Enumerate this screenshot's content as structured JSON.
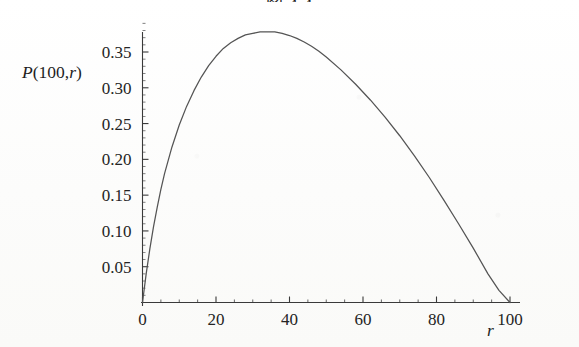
{
  "figure": {
    "caption": "图 4.4",
    "caption_visible_fragment": "图 4.4",
    "background_color": "#fdfdfc",
    "curve_color": "#545454",
    "axis_color": "#3a3a3a"
  },
  "axes": {
    "y_axis_title": "P(100,r)",
    "y_axis_title_parts": {
      "symbol": "P",
      "args": "(100,",
      "variable": "r",
      "close": ")"
    },
    "x_axis_title": "r",
    "x_tick_labels": [
      "0",
      "20",
      "40",
      "60",
      "80",
      "100"
    ],
    "y_tick_labels": [
      "0.05",
      "0.10",
      "0.15",
      "0.20",
      "0.25",
      "0.30",
      "0.35"
    ]
  },
  "chart_data": {
    "type": "line",
    "title": "图 4.4",
    "xlabel": "r",
    "ylabel": "P(100,r)",
    "xlim": [
      0,
      103
    ],
    "ylim": [
      0,
      0.392
    ],
    "grid": false,
    "legend": "none",
    "x_ticks": [
      0,
      20,
      40,
      60,
      80,
      100
    ],
    "y_ticks": [
      0.05,
      0.1,
      0.15,
      0.2,
      0.25,
      0.3,
      0.35
    ],
    "x_minor_tick_step": 5,
    "y_minor_tick_step": 0.01,
    "annotations": [],
    "series": [
      {
        "name": "P(100,r)",
        "color": "#545454",
        "peak_x": 36,
        "peak_y": 0.378,
        "zero_crossings": [
          0,
          100
        ],
        "x": [
          0,
          1,
          2,
          3,
          4,
          5,
          6,
          8,
          10,
          12,
          14,
          16,
          18,
          20,
          22,
          24,
          26,
          28,
          30,
          32,
          34,
          36,
          38,
          40,
          42,
          44,
          46,
          48,
          50,
          54,
          58,
          62,
          66,
          70,
          74,
          78,
          82,
          86,
          90,
          94,
          97,
          100
        ],
        "y": [
          0.0,
          0.04,
          0.075,
          0.106,
          0.133,
          0.158,
          0.18,
          0.217,
          0.248,
          0.274,
          0.296,
          0.315,
          0.331,
          0.344,
          0.355,
          0.363,
          0.369,
          0.374,
          0.376,
          0.378,
          0.378,
          0.378,
          0.376,
          0.373,
          0.369,
          0.364,
          0.358,
          0.351,
          0.343,
          0.325,
          0.305,
          0.283,
          0.259,
          0.233,
          0.205,
          0.175,
          0.143,
          0.11,
          0.076,
          0.04,
          0.017,
          0.0
        ]
      }
    ]
  }
}
